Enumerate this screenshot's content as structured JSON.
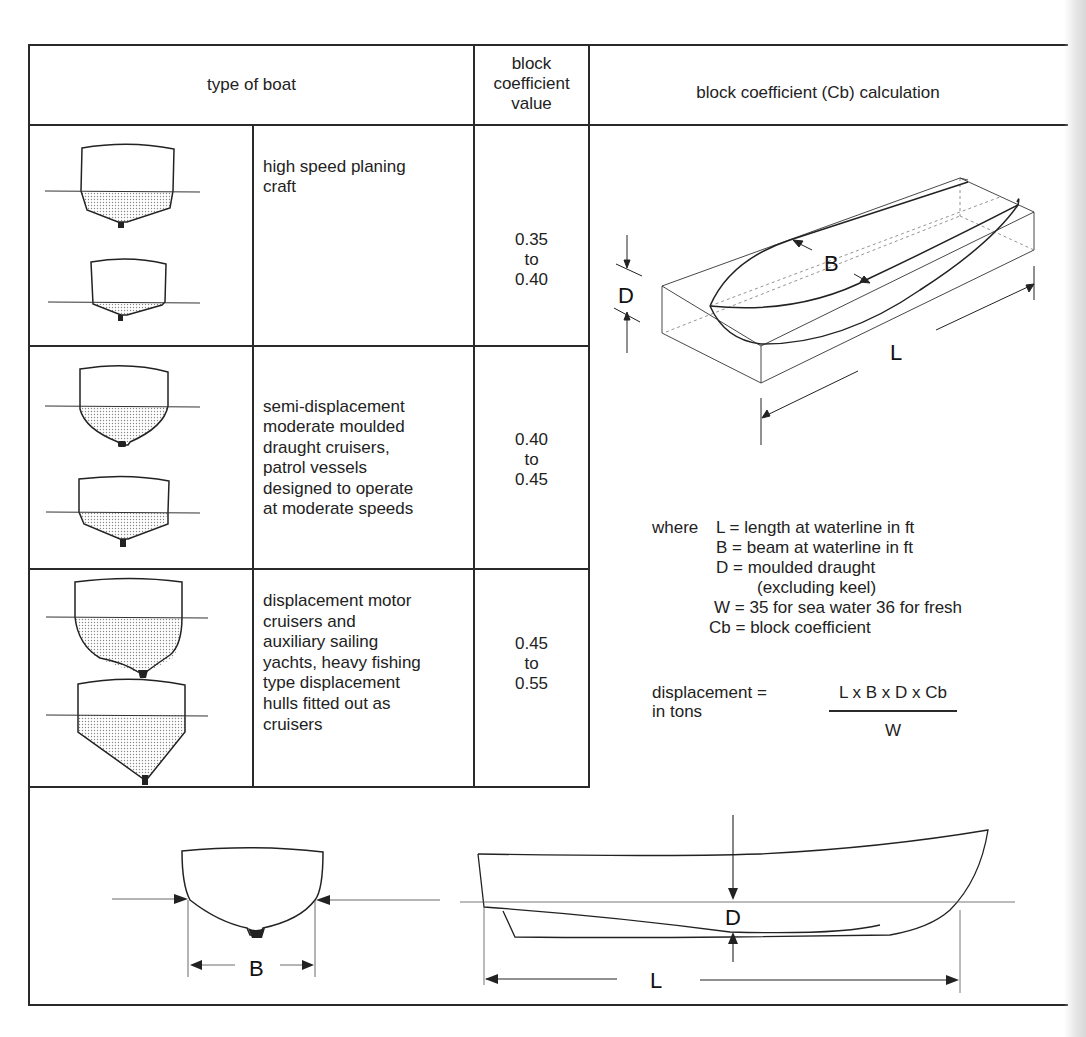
{
  "table": {
    "headers": {
      "type_of_boat": "type of boat",
      "coefficient_value": [
        "block",
        "coefficient",
        "value"
      ],
      "calculation": "block coefficient (Cb) calculation"
    },
    "rows": [
      {
        "description": [
          "high speed planing",
          "craft"
        ],
        "value": [
          "0.35",
          "to",
          "0.40"
        ],
        "hull_sections": [
          "shallow planing V hull",
          "hard-chine planing hull"
        ]
      },
      {
        "description": [
          "semi-displacement",
          "moderate moulded",
          "draught cruisers,",
          "patrol vessels",
          "designed to operate",
          "at moderate speeds"
        ],
        "value": [
          "0.40",
          "to",
          "0.45"
        ],
        "hull_sections": [
          "round-bilge semi-displacement hull",
          "hard-chine semi-displacement hull"
        ]
      },
      {
        "description": [
          "displacement motor",
          "cruisers and",
          "auxiliary sailing",
          "yachts, heavy fishing",
          "type displacement",
          "hulls fitted out as",
          "cruisers"
        ],
        "value": [
          "0.45",
          "to",
          "0.55"
        ],
        "hull_sections": [
          "deep round-bilge displacement hull",
          "deep V displacement hull"
        ]
      }
    ]
  },
  "calculation": {
    "block_diagram_labels": {
      "beam": "B",
      "draught": "D",
      "length": "L"
    },
    "where_label": "where",
    "definitions": [
      {
        "symbol": "L",
        "eq": "=",
        "text": "length at waterline in ft"
      },
      {
        "symbol": "B",
        "eq": "=",
        "text": "beam at waterline in ft"
      },
      {
        "symbol": "D",
        "eq": "=",
        "text": "moulded draught"
      },
      {
        "symbol": "",
        "eq": "",
        "text": "(excluding keel)"
      },
      {
        "symbol": "W",
        "eq": "=",
        "text": "35 for sea water 36 for fresh"
      },
      {
        "symbol": "Cb",
        "eq": "=",
        "text": "block coefficient"
      }
    ],
    "formula": {
      "lhs_line1": "displacement =",
      "lhs_line2": "in tons",
      "numerator": "L x B x D x Cb",
      "denominator": "W"
    }
  },
  "bottom_diagrams": {
    "section_label": "B",
    "profile_draught_label": "D",
    "profile_length_label": "L"
  }
}
